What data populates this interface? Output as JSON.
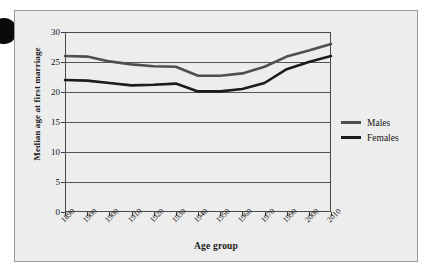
{
  "figure": {
    "background_color": "#ededed",
    "frame_color": "#9a9a9a"
  },
  "bullet_marker": "●",
  "chart_data": {
    "type": "line",
    "title": "",
    "xlabel": "Age group",
    "ylabel": "Median age at first marriage",
    "categories": [
      "1890",
      "1900",
      "1900",
      "1910",
      "1920",
      "1930",
      "1940",
      "1950",
      "1960",
      "1970",
      "1990",
      "2000",
      "2010"
    ],
    "ylim": [
      0,
      30
    ],
    "yticks": [
      0,
      5,
      10,
      15,
      20,
      25,
      30
    ],
    "ytick_labels": [
      "0",
      "5",
      "10",
      "15",
      "20",
      "25",
      "30"
    ],
    "grid": true,
    "grid_axis": "y",
    "legend_position": "right",
    "series": [
      {
        "name": "Males",
        "color": "#4f4f4f",
        "values": [
          26.0,
          25.9,
          25.1,
          24.6,
          24.3,
          24.2,
          22.7,
          22.7,
          23.1,
          24.2,
          25.9,
          26.9,
          28.0
        ]
      },
      {
        "name": "Females",
        "color": "#1c1c1c",
        "values": [
          22.0,
          21.9,
          21.5,
          21.1,
          21.2,
          21.4,
          20.1,
          20.1,
          20.5,
          21.5,
          23.8,
          25.0,
          26.0
        ]
      }
    ]
  },
  "legend": {
    "items": [
      {
        "label": "Males",
        "color": "#4f4f4f"
      },
      {
        "label": "Females",
        "color": "#1c1c1c"
      }
    ]
  }
}
